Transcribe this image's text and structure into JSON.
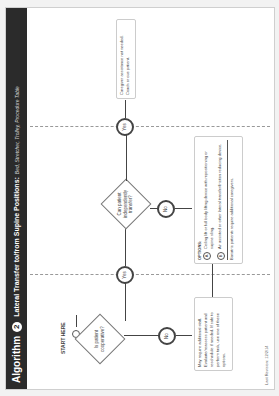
{
  "header": {
    "algorithm_label": "Algorithm",
    "algorithm_number": "2",
    "title": "Lateral Transfer to/from Supine Positions:",
    "subtitle": "Bed, Stretcher, Trolley, Procedure Table"
  },
  "flow": {
    "start_label": "START HERE",
    "decision1": "Is patient cooperative?",
    "decision2": "Can patient independently transfer?",
    "yes_label": "Yes",
    "no_label": "No",
    "box_not_cooperative": "May require additional staff. Evaluate/reassess patient and reschedule if needed. If safe to perform task, use one of these options.",
    "box_independent": "Caregiver assistance not needed. Coach or cue patient.",
    "options": {
      "heading": "OPTIONS:",
      "items": [
        {
          "letter": "A",
          "text": "Ceiling lift or full body lifting device with repositioning or supine sling."
        },
        {
          "letter": "B",
          "text": "Air assisted or other lateral transfer/friction reducing device."
        }
      ],
      "note": "Bariatric patients require additional caregivers."
    }
  },
  "footer": {
    "last_revision": "Last Revision: 12/2/14"
  }
}
